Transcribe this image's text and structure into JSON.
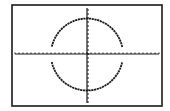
{
  "calculator_graph": {
    "description": "Graphing calculator screen showing a circle plotted as two semicircle functions",
    "colors": {
      "background": "#ffffff",
      "frame": "#1a1a1a",
      "axes": "#1a1a1a",
      "plot": "#1a1a1a"
    },
    "frame": {
      "x": 12,
      "y": 5,
      "width": 150,
      "height": 101
    },
    "axes": {
      "origin": {
        "x": 87,
        "y": 54
      },
      "x_axis": {
        "x1": 15,
        "x2": 159,
        "tick_spacing": 4
      },
      "y_axis": {
        "y1": 8,
        "y2": 103,
        "tick_spacing": 4
      }
    },
    "circle": {
      "center": {
        "x": 87,
        "y": 54.5
      },
      "radius": 36,
      "gap_near_x_axis_deg": 12
    }
  }
}
